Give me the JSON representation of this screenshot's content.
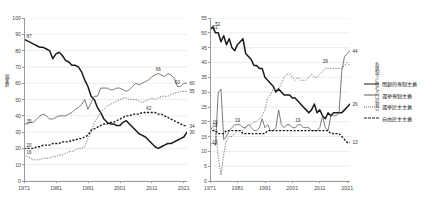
{
  "figure": {
    "background": "#ffffff",
    "grid_color": "#d9d9d9",
    "axis_color": "#9a9a9a"
  },
  "legend": {
    "position": "right",
    "items": [
      {
        "label": "閉鎖的専制主義",
        "style": "solid-thick",
        "color": "#1a1a1a",
        "key": "closed_autocracy"
      },
      {
        "label": "選挙専制主義",
        "style": "solid-thin",
        "color": "#5a5a5a",
        "key": "electoral_autocracy"
      },
      {
        "label": "選挙民主主義",
        "style": "dotted-thin",
        "color": "#6a6a6a",
        "key": "electoral_democracy"
      },
      {
        "label": "自由民主主義",
        "style": "dashed-thick",
        "color": "#1a1a1a",
        "key": "liberal_democracy"
      }
    ]
  },
  "chart_data": [
    {
      "id": "left",
      "type": "line",
      "title": "",
      "xlabel": "",
      "ylabel": "国家数",
      "xlim": [
        1971,
        2022
      ],
      "ylim": [
        0,
        100
      ],
      "yticks": [
        0,
        10,
        20,
        30,
        40,
        50,
        60,
        70,
        80,
        90,
        100
      ],
      "xticks": [
        1971,
        1981,
        1991,
        2001,
        2011,
        2021
      ],
      "grid": true,
      "x": [
        1971,
        1972,
        1973,
        1974,
        1975,
        1976,
        1977,
        1978,
        1979,
        1980,
        1981,
        1982,
        1983,
        1984,
        1985,
        1986,
        1987,
        1988,
        1989,
        1990,
        1991,
        1992,
        1993,
        1994,
        1995,
        1996,
        1997,
        1998,
        1999,
        2000,
        2001,
        2002,
        2003,
        2004,
        2005,
        2006,
        2007,
        2008,
        2009,
        2010,
        2011,
        2012,
        2013,
        2014,
        2015,
        2016,
        2017,
        2018,
        2019,
        2020,
        2021,
        2022
      ],
      "series": [
        {
          "name": "閉鎖的専制主義",
          "style": "solid-thick",
          "color": "#1a1a1a",
          "values": [
            87,
            86,
            85,
            84,
            83,
            82,
            82,
            81,
            80,
            75,
            78,
            79,
            77,
            74,
            73,
            71,
            71,
            70,
            67,
            62,
            58,
            52,
            50,
            45,
            42,
            38,
            36,
            35,
            35,
            34,
            34,
            36,
            37,
            35,
            33,
            31,
            29,
            28,
            27,
            25,
            23,
            21,
            20,
            21,
            22,
            23,
            23,
            24,
            25,
            26,
            27,
            30
          ],
          "labels": [
            {
              "x": 1971,
              "y": 87,
              "text": "87"
            },
            {
              "x": 2022,
              "y": 30,
              "text": "30"
            }
          ]
        },
        {
          "name": "選挙専制主義",
          "style": "solid-thin",
          "color": "#5a5a5a",
          "values": [
            35,
            35,
            36,
            36,
            38,
            40,
            41,
            40,
            38,
            38,
            39,
            40,
            40,
            40,
            41,
            42,
            44,
            45,
            47,
            50,
            44,
            48,
            52,
            52,
            57,
            57,
            57,
            56,
            56,
            57,
            57,
            56,
            55,
            56,
            58,
            60,
            59,
            60,
            61,
            62,
            64,
            65,
            66,
            65,
            64,
            66,
            65,
            63,
            58,
            58,
            60,
            60
          ],
          "labels": [
            {
              "x": 1971,
              "y": 35,
              "text": "35"
            },
            {
              "x": 2013,
              "y": 66,
              "text": "66"
            },
            {
              "x": 2019,
              "y": 58,
              "text": "60"
            },
            {
              "x": 2022,
              "y": 60,
              "text": "60"
            }
          ]
        },
        {
          "name": "選挙民主主義",
          "style": "dotted-thin",
          "color": "#6a6a6a",
          "values": [
            16,
            15,
            14,
            13,
            13,
            13,
            14,
            14,
            14,
            15,
            15,
            16,
            16,
            17,
            18,
            18,
            19,
            20,
            20,
            21,
            26,
            30,
            36,
            39,
            42,
            44,
            46,
            47,
            48,
            49,
            50,
            51,
            51,
            50,
            50,
            50,
            49,
            48,
            49,
            50,
            51,
            50,
            51,
            52,
            52,
            52,
            53,
            54,
            54,
            55,
            55,
            55
          ],
          "labels": [
            {
              "x": 1971,
              "y": 16,
              "text": "16"
            },
            {
              "x": 2022,
              "y": 55,
              "text": "55"
            }
          ]
        },
        {
          "name": "自由民主主義",
          "style": "dashed-thick",
          "color": "#1a1a1a",
          "values": [
            20,
            20,
            20,
            20,
            21,
            21,
            22,
            22,
            22,
            23,
            23,
            23,
            24,
            24,
            24,
            25,
            25,
            26,
            26,
            27,
            28,
            31,
            32,
            33,
            34,
            35,
            35,
            36,
            36,
            37,
            38,
            39,
            40,
            40,
            41,
            41,
            41,
            42,
            42,
            42,
            42,
            42,
            41,
            41,
            40,
            39,
            38,
            37,
            36,
            35,
            34,
            34
          ],
          "labels": [
            {
              "x": 1971,
              "y": 20,
              "text": "20"
            },
            {
              "x": 2010,
              "y": 42,
              "text": "42"
            },
            {
              "x": 2022,
              "y": 34,
              "text": "34"
            }
          ]
        }
      ]
    },
    {
      "id": "right",
      "type": "line",
      "title": "",
      "xlabel": "",
      "ylabel": "各体制下に住む人口の割合",
      "xlim": [
        1971,
        2022
      ],
      "ylim": [
        0,
        55
      ],
      "yticks": [
        0,
        5,
        10,
        15,
        20,
        25,
        30,
        35,
        40,
        45,
        50,
        55
      ],
      "xticks": [
        1971,
        1981,
        1991,
        2001,
        2011,
        2021
      ],
      "grid": true,
      "x": [
        1971,
        1972,
        1973,
        1974,
        1975,
        1976,
        1977,
        1978,
        1979,
        1980,
        1981,
        1982,
        1983,
        1984,
        1985,
        1986,
        1987,
        1988,
        1989,
        1990,
        1991,
        1992,
        1993,
        1994,
        1995,
        1996,
        1997,
        1998,
        1999,
        2000,
        2001,
        2002,
        2003,
        2004,
        2005,
        2006,
        2007,
        2008,
        2009,
        2010,
        2011,
        2012,
        2013,
        2014,
        2015,
        2016,
        2017,
        2018,
        2019,
        2020,
        2021,
        2022
      ],
      "series": [
        {
          "name": "閉鎖的専制主義",
          "style": "solid-thick",
          "color": "#1a1a1a",
          "values": [
            51,
            52,
            50,
            50,
            47,
            49,
            46,
            48,
            45,
            44,
            46,
            47,
            48,
            43,
            42,
            41,
            39,
            39,
            38,
            38,
            35,
            34,
            33,
            32,
            30,
            31,
            30,
            29,
            29,
            29,
            28,
            28,
            27,
            26,
            25,
            24,
            23,
            24,
            26,
            23,
            24,
            22,
            21,
            23,
            22,
            23,
            23,
            23,
            23,
            24,
            25,
            26
          ],
          "labels": [
            {
              "x": 1971,
              "y": 51,
              "text": "51"
            },
            {
              "x": 1972,
              "y": 52,
              "text": "52"
            },
            {
              "x": 2022,
              "y": 26,
              "text": "26"
            }
          ]
        },
        {
          "name": "選挙専制主義",
          "style": "solid-thin",
          "color": "#5a5a5a",
          "values": [
            12,
            13,
            12,
            30,
            31,
            14,
            15,
            17,
            18,
            19,
            19,
            19,
            18,
            18,
            19,
            18,
            17,
            17,
            18,
            21,
            18,
            19,
            17,
            17,
            18,
            24,
            19,
            18,
            19,
            19,
            18,
            18,
            19,
            19,
            18,
            18,
            18,
            17,
            17,
            17,
            18,
            22,
            18,
            17,
            22,
            22,
            22,
            23,
            37,
            42,
            43,
            44
          ],
          "labels": [
            {
              "x": 1971,
              "y": 12,
              "text": "12"
            },
            {
              "x": 1981,
              "y": 19,
              "text": "19"
            },
            {
              "x": 2003,
              "y": 19,
              "text": "19"
            },
            {
              "x": 2022,
              "y": 44,
              "text": "44"
            }
          ]
        },
        {
          "name": "選挙民主主義",
          "style": "dotted-thin",
          "color": "#6a6a6a",
          "values": [
            19,
            18,
            17,
            8,
            2,
            9,
            14,
            15,
            15,
            16,
            17,
            17,
            17,
            18,
            19,
            19,
            20,
            20,
            21,
            22,
            24,
            28,
            29,
            31,
            31,
            31,
            33,
            35,
            36,
            36,
            35,
            34,
            35,
            34,
            34,
            34,
            35,
            36,
            35,
            35,
            36,
            37,
            38,
            38,
            38,
            38,
            38,
            38,
            38,
            39,
            40,
            39
          ],
          "labels": [
            {
              "x": 1971,
              "y": 19,
              "text": "19"
            },
            {
              "x": 2013,
              "y": 39,
              "text": "39"
            }
          ]
        },
        {
          "name": "自由民主主義",
          "style": "dashed-thick",
          "color": "#1a1a1a",
          "values": [
            18,
            17,
            17,
            16,
            16,
            16,
            17,
            17,
            17,
            17,
            17,
            17,
            16,
            16,
            16,
            16,
            16,
            16,
            16,
            16,
            16,
            17,
            17,
            17,
            17,
            17,
            17,
            17,
            17,
            17,
            17,
            17,
            17,
            17,
            17,
            17,
            17,
            17,
            17,
            17,
            17,
            17,
            17,
            17,
            16,
            16,
            16,
            16,
            15,
            14,
            13,
            13
          ],
          "labels": [
            {
              "x": 1971,
              "y": 18,
              "text": "18"
            },
            {
              "x": 2022,
              "y": 13,
              "text": "13"
            }
          ]
        }
      ]
    }
  ]
}
